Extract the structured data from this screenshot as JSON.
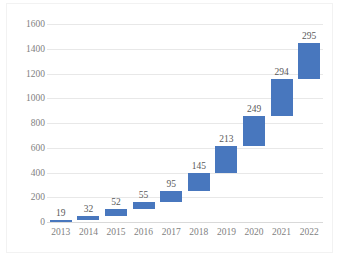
{
  "chart_data": {
    "type": "bar",
    "subtype": "waterfall",
    "title": "",
    "subtitle": "",
    "xlabel": "",
    "ylabel": "",
    "categories": [
      "2013",
      "2014",
      "2015",
      "2016",
      "2017",
      "2018",
      "2019",
      "2020",
      "2021",
      "2022"
    ],
    "values": [
      19,
      32,
      52,
      55,
      95,
      145,
      213,
      249,
      294,
      295
    ],
    "data_labels": [
      "19",
      "32",
      "52",
      "55",
      "95",
      "145",
      "213",
      "249",
      "294",
      "295"
    ],
    "cumulative_start": [
      0,
      19,
      51,
      103,
      158,
      253,
      398,
      611,
      860,
      1154
    ],
    "cumulative_end": [
      19,
      51,
      103,
      158,
      253,
      398,
      611,
      860,
      1154,
      1449
    ],
    "ylim": [
      0,
      1600
    ],
    "y_ticks": [
      "0",
      "200",
      "400",
      "600",
      "800",
      "1000",
      "1200",
      "1400",
      "1600"
    ],
    "y_tick_values": [
      0,
      200,
      400,
      600,
      800,
      1000,
      1200,
      1400,
      1600
    ],
    "grid": true,
    "legend": false,
    "legend_position": "none",
    "series": [
      {
        "name": "Increment",
        "values": [
          19,
          32,
          52,
          55,
          95,
          145,
          213,
          249,
          294,
          295
        ]
      }
    ],
    "colors": {
      "bar": "#4877be",
      "gridline": "#e8e8e8",
      "axis_line": "#d9d9d9",
      "tick_label": "#7f7f7f",
      "data_label": "#595959",
      "background": "#ffffff"
    }
  }
}
